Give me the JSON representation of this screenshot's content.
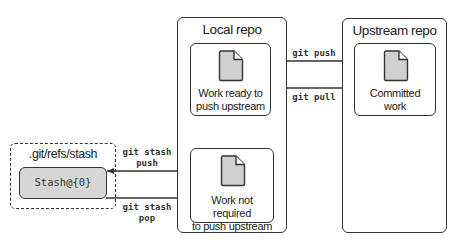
{
  "diagram": {
    "local_repo": {
      "title": "Local repo",
      "cards": [
        {
          "label_line1": "Work ready to",
          "label_line2": "push upstream",
          "icon": "document-icon"
        },
        {
          "label_line1": "Work not required",
          "label_line2": "to push upstream",
          "icon": "document-icon"
        }
      ]
    },
    "upstream_repo": {
      "title": "Upstream repo",
      "cards": [
        {
          "label_line1": "Committed",
          "label_line2": "work",
          "icon": "document-icon"
        }
      ]
    },
    "stash": {
      "title": ".git/refs/stash",
      "entry": "Stash@{0}"
    },
    "edges": [
      {
        "label_line1": "git push",
        "label_line2": "",
        "from": "Work ready to push upstream",
        "to": "Committed work"
      },
      {
        "label_line1": "git pull",
        "label_line2": "",
        "from": "Committed work",
        "to": "Work ready to push upstream"
      },
      {
        "label_line1": "git stash",
        "label_line2": "push",
        "from": "Work not required to push upstream",
        "to": "Stash@{0}"
      },
      {
        "label_line1": "git stash",
        "label_line2": "pop",
        "from": "Stash@{0}",
        "to": "Work not required to push upstream"
      }
    ],
    "colors": {
      "stroke": "#333333",
      "doc_fill": "#d0d0d0",
      "stash_fill": "#d6d6d6",
      "background": "#ffffff"
    }
  }
}
